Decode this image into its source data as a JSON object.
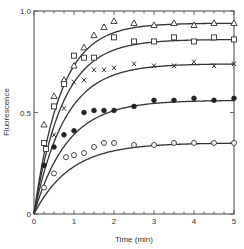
{
  "chart_data": {
    "type": "scatter",
    "title": "",
    "xlabel": "Time (min)",
    "ylabel": "Fluorescence",
    "xlim": [
      0,
      5
    ],
    "ylim": [
      0,
      1.0
    ],
    "x_ticks": [
      0,
      1,
      2,
      3,
      4,
      5
    ],
    "x_tick_labels": [
      "0",
      "1",
      "2",
      "3",
      "4",
      "5"
    ],
    "x_minor_tick_step": 0.25,
    "y_ticks": [
      0,
      0.5,
      1.0
    ],
    "y_tick_labels": [
      "0",
      "0.5",
      "1.0"
    ],
    "grid": false,
    "legend": "none",
    "series": [
      {
        "name": "triangles",
        "marker": "open-triangle",
        "fit": {
          "Fmax": 0.94,
          "k": 1.5
        },
        "x": [
          0.25,
          0.5,
          0.75,
          1.0,
          1.25,
          1.5,
          1.75,
          2.0,
          2.5,
          3.0,
          3.5,
          4.0,
          4.5,
          5.0
        ],
        "y": [
          0.44,
          0.58,
          0.66,
          0.73,
          0.82,
          0.88,
          0.92,
          0.95,
          0.94,
          0.93,
          0.94,
          0.93,
          0.94,
          0.94
        ]
      },
      {
        "name": "squares",
        "marker": "open-square",
        "fit": {
          "Fmax": 0.86,
          "k": 1.4
        },
        "x": [
          0.25,
          0.3,
          0.5,
          0.75,
          1.0,
          1.25,
          1.5,
          2.0,
          2.5,
          3.0,
          3.5,
          4.0,
          4.5,
          5.0
        ],
        "y": [
          0.35,
          0.32,
          0.53,
          0.64,
          0.78,
          0.77,
          0.77,
          0.87,
          0.85,
          0.85,
          0.87,
          0.85,
          0.87,
          0.86
        ]
      },
      {
        "name": "crosses",
        "marker": "cross",
        "fit": {
          "Fmax": 0.74,
          "k": 1.3
        },
        "x": [
          0.5,
          0.75,
          1.0,
          1.25,
          1.5,
          1.75,
          2.0,
          2.5,
          3.0,
          3.5,
          4.0,
          4.5,
          5.0
        ],
        "y": [
          0.39,
          0.52,
          0.65,
          0.66,
          0.71,
          0.71,
          0.72,
          0.74,
          0.73,
          0.73,
          0.75,
          0.73,
          0.74
        ]
      },
      {
        "name": "filled circles",
        "marker": "filled-circle",
        "fit": {
          "Fmax": 0.56,
          "k": 1.2
        },
        "x": [
          0.25,
          0.5,
          0.75,
          1.0,
          1.25,
          1.5,
          1.75,
          2.0,
          2.5,
          3.0,
          3.5,
          4.0,
          4.5,
          5.0
        ],
        "y": [
          0.24,
          0.33,
          0.39,
          0.41,
          0.5,
          0.51,
          0.51,
          0.51,
          0.53,
          0.56,
          0.56,
          0.57,
          0.56,
          0.57
        ]
      },
      {
        "name": "open circles",
        "marker": "open-circle",
        "fit": {
          "Fmax": 0.35,
          "k": 1.1
        },
        "x": [
          0.25,
          0.5,
          0.8,
          1.0,
          1.25,
          1.5,
          1.75,
          2.0,
          2.5,
          3.0,
          3.5,
          4.0,
          4.5,
          5.0
        ],
        "y": [
          0.13,
          0.2,
          0.28,
          0.29,
          0.3,
          0.33,
          0.35,
          0.35,
          0.34,
          0.34,
          0.35,
          0.35,
          0.35,
          0.35
        ]
      }
    ]
  },
  "axes": {
    "xlabel": "Time (min)",
    "ylabel": "Fluorescence"
  }
}
